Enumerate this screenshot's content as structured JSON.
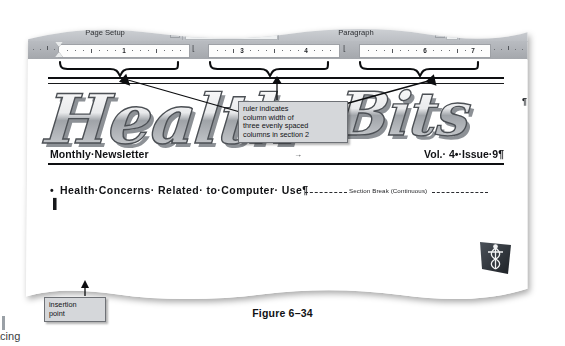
{
  "figure": {
    "caption": "Figure 6–34"
  },
  "ribbon": {
    "groups": [
      {
        "label": "Page Setup",
        "has_dialog_launcher": true
      },
      {
        "label": "Page Background",
        "has_dialog_launcher": false
      },
      {
        "label": "Paragraph",
        "has_dialog_launcher": true
      },
      {
        "label": "Arrange",
        "has_dialog_launcher": false
      }
    ]
  },
  "ruler": {
    "segments": [
      {
        "numbers": [
          "1"
        ]
      },
      {
        "numbers": [
          "3",
          "4"
        ]
      },
      {
        "numbers": [
          "6",
          "7"
        ]
      }
    ],
    "unit": "inches",
    "left_indent_marker": "indent-marker"
  },
  "document": {
    "title_wordart": "Health Bits",
    "logo_alt": "caduceus-medical-logo",
    "newsletter_left": "Monthly·Newsletter",
    "newsletter_right": "Vol.· 4•·Issue·9¶",
    "headline_bullet": "•",
    "headline": "Health·Concerns· Related· to·Computer· Use¶",
    "section_break": "Section Break (Continuous)",
    "tab_arrow": "→",
    "pointer": "i-beam"
  },
  "annotations": {
    "ruler_callout": {
      "lines": [
        "ruler indicates",
        "column width of",
        "three evenly spaced",
        "columns in section 2"
      ]
    },
    "insertion_callout": {
      "lines": [
        "insertion",
        "point"
      ]
    }
  },
  "page_bleed": {
    "text": "acing"
  },
  "colors": {
    "ribbon_bg": "#c9ccd0",
    "ruler_bg": "#aeb1b6",
    "callout_bg": "#d5d7da",
    "callout_border": "#6e7176",
    "ink": "#111215",
    "logo_dark": "#2b2f35"
  }
}
